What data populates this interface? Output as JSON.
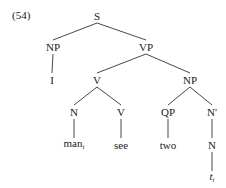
{
  "example_number": "(54)",
  "nodes": {
    "S": {
      "label": "S",
      "x": 97,
      "y": 16
    },
    "NP1": {
      "label": "NP",
      "x": 53,
      "y": 47
    },
    "VP": {
      "label": "VP",
      "x": 146,
      "y": 47
    },
    "I": {
      "label": "I",
      "x": 52,
      "y": 80
    },
    "V1": {
      "label": "V",
      "x": 97,
      "y": 80
    },
    "NP2": {
      "label": "NP",
      "x": 190,
      "y": 80
    },
    "N1": {
      "label": "N",
      "x": 74,
      "y": 112
    },
    "V2": {
      "label": "V",
      "x": 121,
      "y": 112
    },
    "QP": {
      "label": "QP",
      "x": 168,
      "y": 112
    },
    "Nbar": {
      "label": "N'",
      "x": 212,
      "y": 112
    },
    "man": {
      "label": "man",
      "sub": "i",
      "x": 74,
      "y": 145
    },
    "see": {
      "label": "see",
      "x": 121,
      "y": 145
    },
    "two": {
      "label": "two",
      "x": 168,
      "y": 145
    },
    "N2": {
      "label": "N",
      "x": 212,
      "y": 145
    },
    "trace": {
      "label": "t",
      "sub": "i",
      "x": 212,
      "y": 178
    }
  },
  "edges": [
    [
      "S",
      "NP1"
    ],
    [
      "S",
      "VP"
    ],
    [
      "NP1",
      "I"
    ],
    [
      "VP",
      "V1"
    ],
    [
      "VP",
      "NP2"
    ],
    [
      "V1",
      "N1"
    ],
    [
      "V1",
      "V2"
    ],
    [
      "NP2",
      "QP"
    ],
    [
      "NP2",
      "Nbar"
    ],
    [
      "N1",
      "man"
    ],
    [
      "V2",
      "see"
    ],
    [
      "QP",
      "two"
    ],
    [
      "Nbar",
      "N2"
    ],
    [
      "N2",
      "trace"
    ]
  ],
  "colors": {
    "line": "#333333",
    "text": "#1a1a1a"
  }
}
